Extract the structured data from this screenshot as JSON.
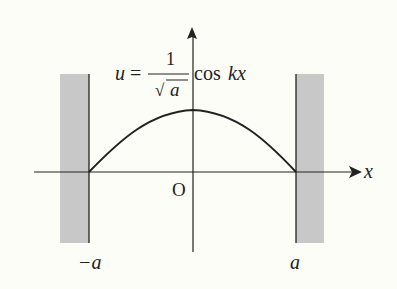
{
  "diagram": {
    "title_formula": {
      "lhs": "u",
      "eq": "=",
      "numerator": "1",
      "denominator_sqrt": "√",
      "denominator_var": "a",
      "func": "cos",
      "arg": "kx"
    },
    "axis_labels": {
      "x": "x",
      "origin": "O"
    },
    "tick_labels": {
      "left": "−a",
      "right": "a"
    },
    "colors": {
      "wall": "#c8c8c8",
      "line": "#222222",
      "background": "#fdfdf8"
    }
  }
}
